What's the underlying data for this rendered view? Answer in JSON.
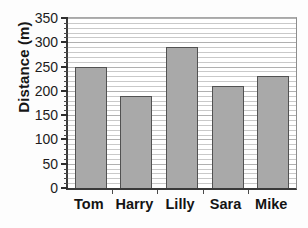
{
  "chart_data": {
    "type": "bar",
    "title": "",
    "xlabel": "",
    "ylabel": "Distance (m)",
    "categories": [
      "Tom",
      "Harry",
      "Lilly",
      "Sara",
      "Mike"
    ],
    "values": [
      250,
      190,
      290,
      210,
      230
    ],
    "ylim": [
      0,
      350
    ],
    "ytick_values": [
      0,
      50,
      100,
      150,
      200,
      250,
      300,
      350
    ],
    "ytick_labels": [
      "0",
      "50",
      "100",
      "150",
      "200",
      "250",
      "300",
      "350"
    ],
    "y_minor_step": 10,
    "grid": true,
    "grid_axis": "y",
    "legend": false,
    "legend_position": "none",
    "bar_color": "#a9a9a9",
    "bar_edge_color": "#525252",
    "axis_color": "#3a3a3a",
    "grid_color": "#c9c9c9",
    "background": "#ffffff"
  }
}
